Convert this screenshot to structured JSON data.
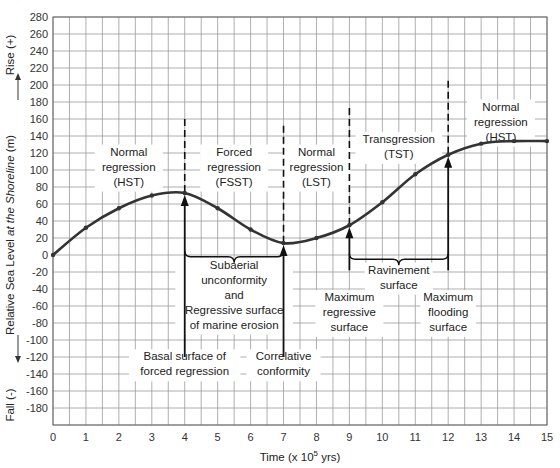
{
  "chart_data": {
    "type": "line",
    "title": "",
    "xlabel": "Time (x 10^5 yrs)",
    "xlabel_parts": {
      "pre": "Time (x 10",
      "sup": "5",
      "post": " yrs)"
    },
    "ylabel": "Relative Sea Level at the Shoreline (m)",
    "ylabel_parts": {
      "pre": "Relative Sea Level ",
      "italic": "at the Shoreline",
      "post": "  (m)"
    },
    "ylabel_rise": "Rise (+)",
    "ylabel_fall": "Fall (-)",
    "xlim": [
      0,
      15
    ],
    "ylim": [
      -200,
      280
    ],
    "xticks": [
      0,
      1,
      2,
      3,
      4,
      5,
      6,
      7,
      8,
      9,
      10,
      11,
      12,
      13,
      14,
      15
    ],
    "yticks": [
      280,
      260,
      240,
      220,
      200,
      180,
      160,
      140,
      120,
      100,
      80,
      60,
      40,
      20,
      0,
      -20,
      -40,
      -60,
      -80,
      -100,
      -120,
      -140,
      -160,
      -180
    ],
    "grid": true,
    "x_minor_step": 0.5,
    "y_step": 20,
    "series": [
      {
        "name": "Relative sea level",
        "x": [
          0,
          1,
          2,
          3,
          4,
          5,
          6,
          7,
          8,
          9,
          10,
          11,
          12,
          13,
          14,
          15
        ],
        "values": [
          0,
          32,
          55,
          70,
          73,
          55,
          30,
          14,
          20,
          35,
          62,
          95,
          118,
          131,
          134,
          134
        ]
      }
    ],
    "boundaries": [
      {
        "x": 4,
        "dashed_top": 160
      },
      {
        "x": 7,
        "dashed_top": 152
      },
      {
        "x": 9,
        "dashed_top": 173
      },
      {
        "x": 12,
        "dashed_top": 205
      }
    ],
    "stage_labels": [
      {
        "x": 2.3,
        "y": 117,
        "lines": [
          "Normal",
          "regression",
          "(HST)"
        ]
      },
      {
        "x": 5.5,
        "y": 117,
        "lines": [
          "Forced",
          "regression",
          "(FSST)"
        ]
      },
      {
        "x": 8.0,
        "y": 117,
        "lines": [
          "Normal",
          "regression",
          "(LST)"
        ]
      },
      {
        "x": 10.5,
        "y": 132,
        "lines": [
          "Transgression",
          "(TST)"
        ]
      },
      {
        "x": 13.6,
        "y": 170,
        "lines": [
          "Normal",
          "regression",
          "(HST)"
        ]
      }
    ],
    "surface_arrows": [
      {
        "x": 4,
        "from": -120,
        "to": 73
      },
      {
        "x": 7,
        "from": -120,
        "to": 14
      },
      {
        "x": 9,
        "from": -18,
        "to": 35
      },
      {
        "x": 12,
        "from": -18,
        "to": 118
      }
    ],
    "braces": [
      {
        "x1": 4,
        "x2": 7,
        "y": -2
      },
      {
        "x1": 9,
        "x2": 12,
        "y": -5
      }
    ],
    "annotations": [
      {
        "x": 5.5,
        "y": -16,
        "lines": [
          "Subaerial",
          "unconformity",
          "and",
          "Regressive surface",
          "of marine erosion"
        ]
      },
      {
        "x": 10.5,
        "y": -22,
        "lines": [
          "Ravinement",
          "surface"
        ]
      },
      {
        "x": 9.0,
        "y": -54,
        "lines": [
          "Maximum",
          "regressive",
          "surface"
        ]
      },
      {
        "x": 12.0,
        "y": -54,
        "lines": [
          "Maximum",
          "flooding",
          "surface"
        ]
      },
      {
        "x": 4.0,
        "y": -124,
        "lines": [
          "Basal surface of",
          "forced regression"
        ]
      },
      {
        "x": 7.0,
        "y": -124,
        "lines": [
          "Correlative",
          "conformity"
        ]
      }
    ],
    "colors": {
      "curve": "#333333",
      "grid": "#9a9a9a",
      "axis": "#666666",
      "arrow": "#111111"
    }
  }
}
